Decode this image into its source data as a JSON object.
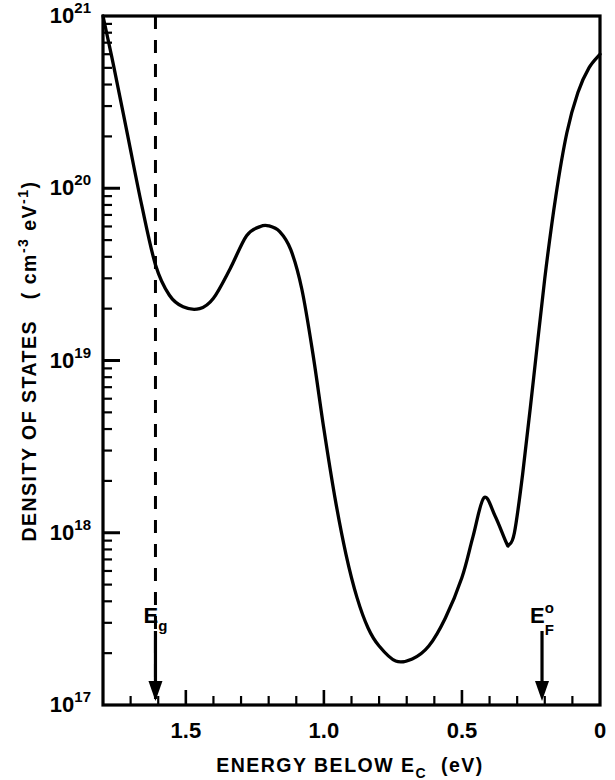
{
  "figure": {
    "background": "#ffffff",
    "ink": "#000000"
  },
  "chart_data": {
    "type": "line",
    "title": "",
    "xlabel_parts": {
      "main": "ENERGY BELOW E",
      "sub": "C",
      "unit": "(eV)"
    },
    "xlabel": "ENERGY BELOW E_C (eV)",
    "ylabel_parts": {
      "main": "DENSITY OF STATES",
      "unit_open": "( cm",
      "unit_sup1": "-3",
      "unit_mid": " eV",
      "unit_sup2": "-1",
      "unit_close": ")"
    },
    "ylabel": "DENSITY OF STATES (cm-3 eV-1)",
    "x_axis": {
      "tick_labels": [
        "1.5",
        "1.0",
        "0.5",
        "0"
      ],
      "tick_values": [
        1.5,
        1.0,
        0.5,
        0.0
      ],
      "minor_tick_step": 0.1,
      "xlim": [
        1.8,
        0.0
      ],
      "direction": "reversed",
      "grid": false
    },
    "y_axis": {
      "scale": "log",
      "tick_labels": [
        "10^21",
        "10^20",
        "10^19",
        "10^18",
        "10^17"
      ],
      "tick_mantissa": [
        "10",
        "10",
        "10",
        "10",
        "10"
      ],
      "tick_exponents": [
        "21",
        "20",
        "19",
        "18",
        "17"
      ],
      "tick_values": [
        1e+21,
        1e+20,
        1e+19,
        1e+18,
        1e+17
      ],
      "ylim": [
        1e+17,
        1e+21
      ],
      "grid": false
    },
    "series": [
      {
        "name": "density of states",
        "style": "solid",
        "points_x": [
          1.8,
          1.76,
          1.71,
          1.66,
          1.61,
          1.56,
          1.51,
          1.45,
          1.4,
          1.34,
          1.28,
          1.23,
          1.2,
          1.16,
          1.12,
          1.08,
          1.04,
          1.0,
          0.96,
          0.92,
          0.88,
          0.84,
          0.8,
          0.74,
          0.68,
          0.62,
          0.56,
          0.5,
          0.46,
          0.42,
          0.38,
          0.34,
          0.33,
          0.31,
          0.28,
          0.24,
          0.2,
          0.16,
          0.12,
          0.08,
          0.04,
          0.0
        ],
        "points_y": [
          1e+21,
          5e+20,
          2e+20,
          8e+19,
          3.6e+19,
          2.4e+19,
          2.05e+19,
          2e+19,
          2.3e+19,
          3.4e+19,
          5.3e+19,
          6e+19,
          6.05e+19,
          5.6e+19,
          4.4e+19,
          2.6e+19,
          1.1e+19,
          4e+18,
          1.6e+18,
          7.5e+17,
          4.2e+17,
          2.8e+17,
          2.2e+17,
          1.8e+17,
          1.85e+17,
          2.2e+17,
          3.2e+17,
          5.5e+17,
          9.5e+17,
          1.6e+18,
          1.25e+18,
          8.8e+17,
          8.5e+17,
          1e+18,
          2.2e+18,
          8e+18,
          3e+19,
          9e+19,
          2.1e+20,
          3.6e+20,
          5e+20,
          6e+20
        ]
      }
    ],
    "annotations": [
      {
        "id": "eg",
        "label_main": "E",
        "label_sub": "g",
        "label_sup": "",
        "x": 1.61,
        "marker": "down-arrow",
        "vertical_dashed_line": true
      },
      {
        "id": "ef0",
        "label_main": "E",
        "label_sub": "F",
        "label_sup": "o",
        "x": 0.21,
        "marker": "down-arrow",
        "vertical_dashed_line": false
      }
    ]
  }
}
